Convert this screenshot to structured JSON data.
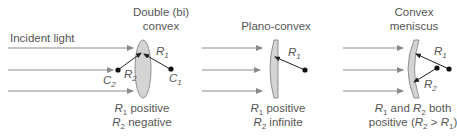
{
  "diagram": {
    "incident_label": "Incident light",
    "colors": {
      "arrow": "#8a8a8a",
      "lens_fill": "#d4d4d4",
      "lens_stroke": "#7a7a7a",
      "radius_line": "#333333",
      "center_dot": "#111111",
      "text": "#555555"
    },
    "lenses": [
      {
        "title_line1": "Double (bi)",
        "title_line2": "convex",
        "r1_label": "R",
        "r1_sub": "1",
        "r2_label": "R",
        "r2_sub": "2",
        "c1_label": "C",
        "c1_sub": "1",
        "c2_label": "C",
        "c2_sub": "2",
        "caption_line1_a": "R",
        "caption_line1_sub": "1",
        "caption_line1_b": " positive",
        "caption_line2_a": "R",
        "caption_line2_sub": "2",
        "caption_line2_b": " negative"
      },
      {
        "title_line1": "Plano-convex",
        "r1_label": "R",
        "r1_sub": "1",
        "caption_line1_a": "R",
        "caption_line1_sub": "1",
        "caption_line1_b": " positive",
        "caption_line2_a": "R",
        "caption_line2_sub": "2",
        "caption_line2_b": " infinite"
      },
      {
        "title_line1": "Convex",
        "title_line2": "meniscus",
        "r1_label": "R",
        "r1_sub": "1",
        "r2_label": "R",
        "r2_sub": "2",
        "caption_line1_a": "R",
        "caption_line1_sub": "1",
        "caption_line1_mid": " and ",
        "caption_line1_c": "R",
        "caption_line1_csub": "2",
        "caption_line1_d": " both",
        "caption_line2_a": "positive (",
        "caption_line2_b": "R",
        "caption_line2_bsub": "2",
        "caption_line2_c": " > ",
        "caption_line2_d": "R",
        "caption_line2_dsub": "1",
        "caption_line2_e": ")"
      }
    ]
  }
}
